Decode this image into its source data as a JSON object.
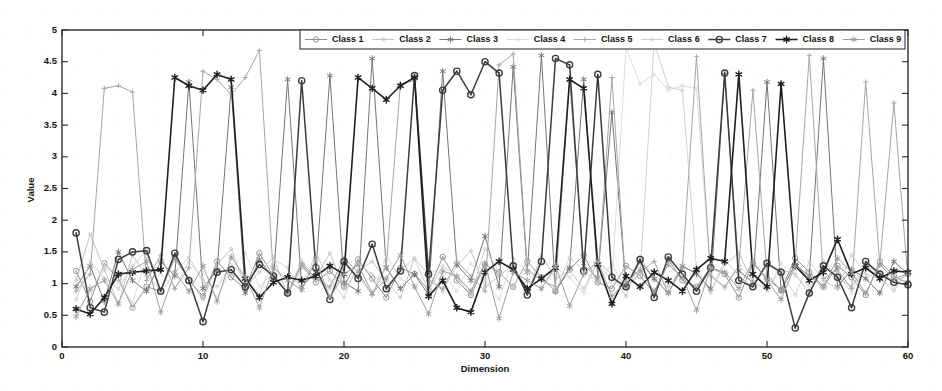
{
  "chart_data": {
    "type": "line",
    "title": "",
    "xlabel": "Dimension",
    "ylabel": "Value",
    "xlim": [
      0,
      60
    ],
    "ylim": [
      0,
      5
    ],
    "xticks": [
      0,
      10,
      20,
      30,
      40,
      50,
      60
    ],
    "xtick_labels": [
      "0",
      "10",
      "20",
      "30",
      "40",
      "50",
      "60"
    ],
    "yticks": [
      0,
      0.5,
      1,
      1.5,
      2,
      2.5,
      3,
      3.5,
      4,
      4.5,
      5
    ],
    "ytick_labels": [
      "0",
      "0.5",
      "1",
      "1.5",
      "2",
      "2.5",
      "3",
      "3.5",
      "4",
      "4.5",
      "5"
    ],
    "grid": false,
    "legend_position": "top-center",
    "legend_orientation": "horizontal",
    "x": [
      1,
      2,
      3,
      4,
      5,
      6,
      7,
      8,
      9,
      10,
      11,
      12,
      13,
      14,
      15,
      16,
      17,
      18,
      19,
      20,
      21,
      22,
      23,
      24,
      25,
      26,
      27,
      28,
      29,
      30,
      31,
      32,
      33,
      34,
      35,
      36,
      37,
      38,
      39,
      40,
      41,
      42,
      43,
      44,
      45,
      46,
      47,
      48,
      49,
      50,
      51,
      52,
      53,
      54,
      55,
      56,
      57,
      58,
      59,
      60
    ],
    "series": [
      {
        "name": "Class 1",
        "color": "#8f8f8f",
        "marker": "circle",
        "linewidth": 1.0,
        "values": [
          1.2,
          0.72,
          1.32,
          1.08,
          0.62,
          0.95,
          0.88,
          1.42,
          1.05,
          0.8,
          1.35,
          1.1,
          0.92,
          1.48,
          1.12,
          0.85,
          1.3,
          1.02,
          1.2,
          0.95,
          1.38,
          1.08,
          0.78,
          1.25,
          1.15,
          0.9,
          1.42,
          1.05,
          0.82,
          1.3,
          1.18,
          0.95,
          1.35,
          1.1,
          0.88,
          1.22,
          1.45,
          1.02,
          0.92,
          1.28,
          1.12,
          0.85,
          1.38,
          1.05,
          0.95,
          1.25,
          1.15,
          0.78,
          1.32,
          1.08,
          0.9,
          1.4,
          1.18,
          0.95,
          1.28,
          1.1,
          0.82,
          1.35,
          1.12,
          1.0
        ]
      },
      {
        "name": "Class 2",
        "color": "#bdbdbd",
        "marker": "dot",
        "linewidth": 0.9,
        "values": [
          1.05,
          1.78,
          1.22,
          0.68,
          1.45,
          1.12,
          0.9,
          1.38,
          1.08,
          0.75,
          1.3,
          1.55,
          0.95,
          1.18,
          1.42,
          0.82,
          1.25,
          1.1,
          1.48,
          0.92,
          1.2,
          1.35,
          1.05,
          0.78,
          1.4,
          1.15,
          0.88,
          1.28,
          1.52,
          0.95,
          1.12,
          1.3,
          0.85,
          1.45,
          1.08,
          1.2,
          0.92,
          1.35,
          1.15,
          0.8,
          1.42,
          1.05,
          0.95,
          1.25,
          1.18,
          0.88,
          1.3,
          1.48,
          1.02,
          0.92,
          1.22,
          1.15,
          0.85,
          1.35,
          1.1,
          0.95,
          1.28,
          1.18,
          1.05,
          1.12
        ]
      },
      {
        "name": "Class 3",
        "color": "#757575",
        "marker": "star",
        "linewidth": 1.0,
        "values": [
          0.95,
          1.28,
          0.72,
          1.5,
          1.05,
          0.88,
          1.35,
          1.12,
          4.18,
          0.92,
          1.22,
          4.1,
          0.85,
          1.38,
          1.08,
          4.22,
          0.95,
          1.18,
          4.28,
          1.02,
          0.88,
          4.55,
          1.25,
          0.92,
          1.15,
          0.82,
          4.35,
          1.3,
          1.05,
          1.75,
          0.95,
          4.42,
          1.18,
          4.6,
          0.88,
          1.25,
          4.22,
          1.1,
          3.7,
          0.95,
          1.35,
          1.08,
          0.85,
          1.28,
          1.15,
          0.92,
          4.3,
          1.2,
          1.02,
          4.18,
          0.88,
          1.3,
          1.12,
          4.55,
          0.95,
          1.22,
          1.08,
          0.85,
          1.35,
          1.15
        ]
      },
      {
        "name": "Class 4",
        "color": "#d6d6d6",
        "marker": "faint",
        "linewidth": 0.85,
        "values": [
          1.1,
          0.85,
          1.28,
          1.02,
          0.7,
          1.42,
          1.15,
          0.92,
          1.35,
          1.08,
          0.78,
          1.25,
          1.48,
          0.95,
          1.18,
          0.85,
          1.38,
          1.05,
          0.92,
          1.3,
          1.12,
          0.82,
          1.45,
          1.08,
          0.95,
          1.22,
          1.15,
          0.88,
          1.32,
          1.05,
          0.75,
          1.4,
          1.18,
          0.92,
          1.25,
          1.1,
          0.85,
          1.35,
          1.02,
          4.72,
          4.15,
          4.3,
          4.05,
          4.12,
          4.08,
          1.15,
          0.92,
          1.28,
          1.05,
          0.88,
          1.32,
          1.12,
          0.95,
          1.22,
          1.18,
          0.85,
          1.3,
          1.08,
          0.92,
          1.2
        ]
      },
      {
        "name": "Class 5",
        "color": "#a5a5a5",
        "marker": "plus",
        "linewidth": 1.0,
        "values": [
          0.88,
          1.15,
          4.08,
          4.12,
          4.02,
          1.05,
          1.45,
          0.92,
          1.25,
          4.35,
          4.22,
          3.98,
          4.25,
          4.68,
          1.1,
          0.85,
          1.32,
          1.08,
          0.95,
          1.4,
          1.18,
          0.82,
          1.28,
          4.15,
          4.2,
          1.05,
          0.92,
          1.35,
          1.12,
          0.88,
          4.45,
          4.62,
          1.22,
          1.05,
          0.95,
          4.2,
          1.3,
          1.08,
          4.25,
          0.92,
          1.18,
          1.35,
          0.85,
          1.25,
          4.58,
          1.12,
          0.95,
          1.28,
          4.05,
          1.15,
          0.88,
          1.32,
          4.6,
          1.08,
          1.22,
          0.92,
          4.18,
          1.3,
          3.85,
          1.05
        ]
      },
      {
        "name": "Class 6",
        "color": "#c9c9c9",
        "marker": "faint",
        "linewidth": 0.85,
        "values": [
          0.75,
          1.35,
          1.08,
          0.92,
          1.28,
          1.52,
          0.85,
          1.18,
          1.42,
          1.02,
          0.95,
          1.3,
          1.12,
          0.82,
          1.38,
          1.25,
          0.9,
          1.48,
          1.05,
          0.78,
          1.32,
          1.15,
          0.95,
          1.22,
          1.4,
          0.88,
          1.28,
          1.1,
          0.82,
          1.55,
          1.18,
          0.95,
          1.35,
          1.08,
          0.88,
          1.42,
          1.2,
          1.02,
          1.3,
          0.92,
          1.15,
          4.8,
          4.1,
          4.05,
          1.25,
          0.85,
          1.38,
          1.12,
          0.95,
          1.28,
          1.18,
          0.82,
          1.35,
          1.05,
          0.92,
          1.45,
          1.15,
          1.08,
          0.88,
          1.22
        ]
      },
      {
        "name": "Class 7",
        "color": "#3d3d3d",
        "marker": "circle-dark",
        "linewidth": 1.5,
        "values": [
          1.8,
          0.62,
          0.55,
          1.38,
          1.5,
          1.52,
          0.88,
          1.48,
          1.05,
          0.4,
          1.18,
          1.22,
          0.95,
          1.3,
          1.12,
          0.85,
          4.2,
          1.25,
          0.75,
          1.35,
          1.08,
          1.62,
          0.92,
          1.2,
          4.28,
          1.15,
          4.05,
          4.35,
          3.98,
          4.5,
          4.32,
          1.28,
          0.82,
          1.35,
          4.55,
          4.45,
          1.2,
          4.3,
          1.1,
          0.95,
          1.38,
          0.78,
          1.42,
          1.15,
          0.88,
          1.25,
          4.32,
          1.05,
          0.95,
          1.32,
          1.18,
          0.3,
          0.85,
          1.28,
          1.1,
          0.62,
          1.35,
          1.15,
          1.02,
          0.98
        ]
      },
      {
        "name": "Class 8",
        "color": "#1f1f1f",
        "marker": "star-dark",
        "linewidth": 1.6,
        "values": [
          0.6,
          0.52,
          0.78,
          1.15,
          1.18,
          1.2,
          1.22,
          4.25,
          4.12,
          4.05,
          4.3,
          4.22,
          1.08,
          0.78,
          1.02,
          1.1,
          1.05,
          1.12,
          1.28,
          1.15,
          4.25,
          4.08,
          3.9,
          4.12,
          4.25,
          0.8,
          1.05,
          0.62,
          0.55,
          1.18,
          1.35,
          1.22,
          0.92,
          1.08,
          1.25,
          4.22,
          4.08,
          1.3,
          0.68,
          1.12,
          0.95,
          1.18,
          1.05,
          0.88,
          1.22,
          1.4,
          1.35,
          4.3,
          1.15,
          0.95,
          4.15,
          1.28,
          1.05,
          1.18,
          1.7,
          1.15,
          1.25,
          1.08,
          1.2,
          1.18
        ]
      },
      {
        "name": "Class 9",
        "color": "#9e9e9e",
        "marker": "star-light",
        "linewidth": 1.0,
        "values": [
          0.48,
          0.92,
          1.05,
          0.68,
          1.22,
          1.35,
          0.55,
          1.18,
          0.88,
          1.28,
          0.72,
          1.42,
          1.1,
          0.62,
          1.25,
          1.05,
          0.9,
          1.38,
          0.78,
          1.15,
          1.3,
          0.85,
          1.08,
          1.45,
          0.95,
          0.52,
          1.2,
          1.12,
          0.88,
          1.32,
          0.45,
          1.18,
          1.05,
          0.92,
          1.28,
          0.65,
          1.15,
          1.35,
          0.8,
          1.02,
          1.22,
          0.88,
          1.3,
          1.1,
          0.58,
          1.25,
          1.18,
          0.92,
          1.35,
          1.05,
          0.75,
          1.28,
          1.12,
          0.95,
          1.4,
          1.18,
          0.85,
          1.3,
          1.08,
          1.15
        ]
      }
    ]
  },
  "axes": {
    "xlabel": "Dimension",
    "ylabel": "Value"
  },
  "legend": {
    "entries": [
      "Class 1",
      "Class 2",
      "Class 3",
      "Class 4",
      "Class 5",
      "Class 6",
      "Class 7",
      "Class 8",
      "Class 9"
    ]
  }
}
